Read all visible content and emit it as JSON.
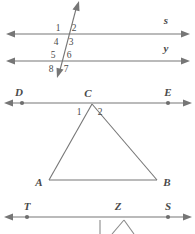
{
  "figure": {
    "background_color": "#ffffff",
    "line_color": "#767676",
    "label_color": "#4a4a4a"
  },
  "parallel_lines": {
    "line_s": {
      "label": "s",
      "label_x": 166,
      "label_y": 24,
      "y": 34,
      "x_start": 8,
      "x_end": 188
    },
    "line_y": {
      "label": "y",
      "label_x": 166,
      "label_y": 52,
      "y": 61,
      "x_start": 8,
      "x_end": 188
    },
    "transversal": {
      "x_top": 78,
      "y_top": 3,
      "x_bottom": 58,
      "y_bottom": 76
    },
    "angle_numbers": [
      {
        "text": "1",
        "x": 58,
        "y": 31
      },
      {
        "text": "2",
        "x": 74,
        "y": 31
      },
      {
        "text": "4",
        "x": 56,
        "y": 45
      },
      {
        "text": "3",
        "x": 71,
        "y": 45
      },
      {
        "text": "5",
        "x": 53,
        "y": 58
      },
      {
        "text": "6",
        "x": 69,
        "y": 58
      },
      {
        "text": "8",
        "x": 51,
        "y": 72
      },
      {
        "text": "7",
        "x": 66,
        "y": 72
      }
    ]
  },
  "triangle_figure": {
    "line_de": {
      "y": 103,
      "x_start": 6,
      "x_end": 190,
      "point_d": {
        "label": "D",
        "x": 22,
        "label_x": 19,
        "label_y": 96
      },
      "point_e": {
        "label": "E",
        "x": 168,
        "label_x": 165,
        "label_y": 96
      }
    },
    "vertex_c": {
      "label": "C",
      "x": 92,
      "y": 103,
      "label_x": 88,
      "label_y": 97
    },
    "vertex_a": {
      "label": "A",
      "x": 49,
      "y": 180,
      "label_x": 37,
      "label_y": 186
    },
    "vertex_b": {
      "label": "B",
      "x": 157,
      "y": 180,
      "label_x": 163,
      "label_y": 186
    },
    "angle_numbers": [
      {
        "text": "1",
        "x": 79,
        "y": 114
      },
      {
        "text": "2",
        "x": 99,
        "y": 114
      }
    ]
  },
  "bottom_line": {
    "y": 217,
    "x_start": 6,
    "x_end": 190,
    "point_t": {
      "label": "T",
      "x": 27,
      "label_x": 24,
      "label_y": 210
    },
    "point_z": {
      "label": "Z",
      "x": 118,
      "label_x": 115,
      "label_y": 210
    },
    "point_s": {
      "label": "S",
      "x": 168,
      "label_x": 165,
      "label_y": 210
    },
    "angle_marks": {
      "left_tick_x": 100,
      "apex_x": 124,
      "right_x": 134
    }
  }
}
